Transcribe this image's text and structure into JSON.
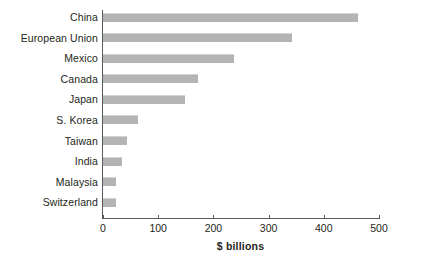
{
  "chart_data": {
    "type": "bar",
    "orientation": "horizontal",
    "title": "",
    "subtitle": "",
    "xlabel": "$ billions",
    "ylabel": "",
    "categories": [
      "China",
      "European Union",
      "Mexico",
      "Canada",
      "Japan",
      "S. Korea",
      "Taiwan",
      "India",
      "Malaysia",
      "Switzerland"
    ],
    "values": [
      462,
      342,
      237,
      172,
      148,
      63,
      44,
      34,
      24,
      24
    ],
    "series": [
      {
        "name": "",
        "values": [
          462,
          342,
          237,
          172,
          148,
          63,
          44,
          34,
          24,
          24
        ]
      }
    ],
    "xlim": [
      0,
      500
    ],
    "xticks": [
      0,
      100,
      200,
      300,
      400,
      500
    ],
    "xtick_labels": [
      "0",
      "100",
      "200",
      "300",
      "400",
      "500"
    ],
    "grid": false,
    "legend": false,
    "legend_position": "none",
    "bar_color": "#b4b4b4",
    "axis_color": "#58595b",
    "text_color": "#231f20",
    "background_color": "#ffffff"
  }
}
